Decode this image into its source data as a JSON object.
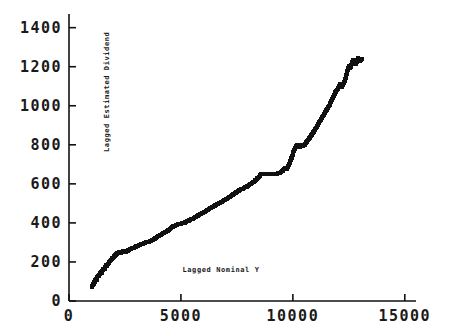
{
  "chart_data": {
    "type": "scatter",
    "title": "",
    "xlabel": "Lagged Nominal Y",
    "ylabel": "Lagged Estimated Dividend",
    "xlim": [
      0,
      15500
    ],
    "ylim": [
      0,
      1470
    ],
    "grid": false,
    "legend": null,
    "xticks": [
      0,
      5000,
      10000,
      15000
    ],
    "xtick_labels": [
      "0",
      "5000",
      "10000",
      "15000"
    ],
    "yticks": [
      0,
      200,
      400,
      600,
      800,
      1000,
      1200,
      1400
    ],
    "ytick_labels": [
      "0",
      "200",
      "400",
      "600",
      "800",
      "1000",
      "1200",
      "1400"
    ],
    "marker": "square",
    "marker_color": "#111111",
    "marker_size": 4,
    "x": [
      1020,
      1040,
      1060,
      1080,
      1110,
      1140,
      1160,
      1180,
      1200,
      1230,
      1260,
      1300,
      1340,
      1380,
      1420,
      1460,
      1500,
      1540,
      1580,
      1620,
      1660,
      1700,
      1740,
      1790,
      1840,
      1890,
      1940,
      1990,
      2040,
      2090,
      2140,
      2190,
      2240,
      2290,
      2340,
      2390,
      2440,
      2500,
      2560,
      2620,
      2680,
      2740,
      2800,
      2870,
      2940,
      3010,
      3080,
      3150,
      3220,
      3300,
      3380,
      3460,
      3540,
      3620,
      3700,
      3780,
      3860,
      3940,
      4020,
      4110,
      4200,
      4290,
      4380,
      4470,
      4560,
      4660,
      4760,
      4860,
      4960,
      5060,
      5160,
      5270,
      5380,
      5490,
      5600,
      5710,
      5820,
      5940,
      6060,
      6180,
      6300,
      6420,
      6540,
      6660,
      6780,
      6900,
      7020,
      7150,
      7280,
      7410,
      7540,
      7670,
      7800,
      7930,
      8060,
      8190,
      8320,
      8450,
      8580,
      8700,
      8820,
      8940,
      9060,
      9180,
      9300,
      9420,
      9540,
      9640,
      9720,
      9800,
      9880,
      9960,
      10040,
      10120,
      10200,
      10280,
      10360,
      10440,
      10520,
      10600,
      10690,
      10780,
      10870,
      10960,
      11050,
      11140,
      11230,
      11320,
      11410,
      11500,
      11580,
      11660,
      11740,
      11820,
      11900,
      11970,
      12040,
      12110,
      12180,
      12250,
      12320,
      12390,
      12450,
      12510,
      12570,
      12630,
      12690,
      12750,
      12810,
      12870,
      12930,
      12990,
      13040,
      13090
    ],
    "y": [
      70,
      78,
      85,
      80,
      92,
      100,
      95,
      108,
      115,
      110,
      122,
      130,
      128,
      140,
      148,
      145,
      158,
      165,
      162,
      175,
      183,
      180,
      192,
      200,
      205,
      212,
      218,
      225,
      232,
      238,
      242,
      248,
      252,
      250,
      248,
      252,
      256,
      250,
      254,
      258,
      262,
      266,
      270,
      272,
      276,
      280,
      284,
      286,
      290,
      294,
      298,
      302,
      300,
      306,
      312,
      318,
      322,
      328,
      334,
      340,
      346,
      352,
      358,
      366,
      374,
      382,
      388,
      392,
      396,
      398,
      402,
      408,
      414,
      420,
      426,
      434,
      442,
      450,
      458,
      466,
      474,
      482,
      490,
      498,
      506,
      514,
      522,
      532,
      542,
      552,
      562,
      572,
      578,
      586,
      596,
      606,
      618,
      632,
      648,
      652,
      648,
      652,
      650,
      648,
      652,
      656,
      668,
      680,
      676,
      690,
      710,
      740,
      770,
      790,
      800,
      788,
      798,
      794,
      800,
      812,
      826,
      840,
      856,
      872,
      888,
      906,
      924,
      942,
      958,
      976,
      992,
      1010,
      1030,
      1050,
      1068,
      1082,
      1096,
      1110,
      1098,
      1112,
      1128,
      1160,
      1188,
      1204,
      1196,
      1216,
      1232,
      1222,
      1212,
      1236,
      1244,
      1230,
      1236,
      1238
    ]
  }
}
